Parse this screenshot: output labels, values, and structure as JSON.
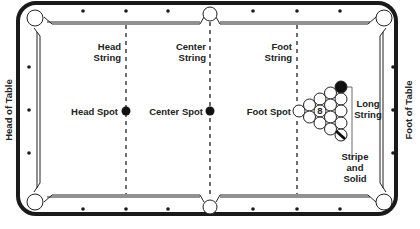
{
  "labels": {
    "head_of_table": "Head of Table",
    "foot_of_table": "Foot of Table",
    "head_string": [
      "Head",
      "String"
    ],
    "center_string": [
      "Center",
      "String"
    ],
    "foot_string": [
      "Foot",
      "String"
    ],
    "head_spot": "Head Spot",
    "center_spot": "Center Spot",
    "foot_spot": "Foot Spot",
    "long_string": [
      "Long",
      "String"
    ],
    "stripe_and_solid": [
      "Stripe",
      "and",
      "Solid"
    ],
    "eight_ball": "8"
  },
  "colors": {
    "rail": "#1a1a1a",
    "line": "#222222",
    "background": "#ffffff"
  }
}
